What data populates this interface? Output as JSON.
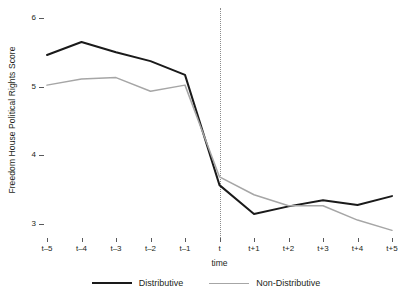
{
  "chart_data": {
    "type": "line",
    "title": "",
    "xlabel": "time",
    "ylabel": "Freedom House Political Rights Score",
    "categories": [
      "t–5",
      "t–4",
      "t–3",
      "t–2",
      "t–1",
      "t",
      "t+1",
      "t+2",
      "t+3",
      "t+4",
      "t+5"
    ],
    "ylim": [
      2.75,
      6.15
    ],
    "yticks": [
      3,
      4,
      5,
      6
    ],
    "ytick_labels": [
      "3",
      "4",
      "5",
      "6"
    ],
    "grid": false,
    "legend_position": "bottom-center",
    "annotations": [
      {
        "type": "vline",
        "x": "t",
        "style": "dotted",
        "color": "#8c8c8c"
      }
    ],
    "series": [
      {
        "name": "Distributive",
        "color": "#1a1a1a",
        "width": 2,
        "values": [
          5.46,
          5.65,
          5.5,
          5.37,
          5.17,
          3.56,
          3.14,
          3.25,
          3.34,
          3.27,
          3.4
        ]
      },
      {
        "name": "Non-Distributive",
        "color": "#a6a6a6",
        "width": 1.5,
        "values": [
          5.02,
          5.11,
          5.13,
          4.93,
          5.02,
          3.68,
          3.42,
          3.26,
          3.26,
          3.05,
          2.9
        ]
      }
    ]
  },
  "legend": {
    "items": [
      {
        "label": "Distributive",
        "swatch": "dark"
      },
      {
        "label": "Non-Distributive",
        "swatch": "light"
      }
    ]
  },
  "axis": {
    "x_title": "time",
    "y_title": "Freedom House Political Rights Score"
  }
}
